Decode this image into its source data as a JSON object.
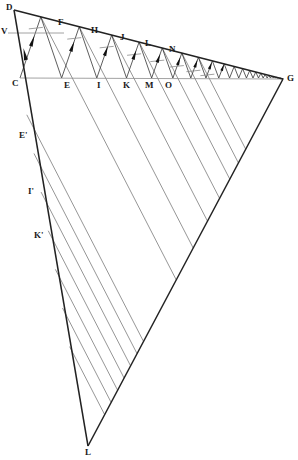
{
  "figure": {
    "background_color": "#ffffff",
    "stroke_color_main": "#222222",
    "stroke_color_thin": "#7a7a7a",
    "arrow_color": "#111111",
    "width": 298,
    "height": 460
  },
  "vertices": {
    "D": {
      "label": "D",
      "x": 14,
      "y": 10,
      "lx": 6,
      "ly": 3
    },
    "V": {
      "label": "V",
      "x": 8,
      "y": 33,
      "lx": 1,
      "ly": 27
    },
    "C": {
      "label": "C",
      "x": 20,
      "y": 78,
      "lx": 12,
      "ly": 79
    },
    "G": {
      "label": "G",
      "x": 283,
      "y": 79,
      "lx": 287,
      "ly": 74
    },
    "L": {
      "label": "L",
      "x": 88,
      "y": 446,
      "lx": 85,
      "ly": 448
    }
  },
  "top_points": [
    {
      "label": "F",
      "x": 62,
      "y": 27,
      "lx": 58,
      "ly": 18
    },
    {
      "label": "H",
      "x": 94,
      "y": 35,
      "lx": 91,
      "ly": 26
    },
    {
      "label": "J",
      "x": 123,
      "y": 42,
      "lx": 120,
      "ly": 33
    },
    {
      "label": "L",
      "x": 148,
      "y": 48,
      "lx": 145,
      "ly": 39
    },
    {
      "label": "N",
      "x": 172,
      "y": 54,
      "lx": 169,
      "ly": 45
    }
  ],
  "bottom_points": [
    {
      "label": "C",
      "x": 20,
      "y": 78
    },
    {
      "label": "E",
      "x": 68,
      "y": 78,
      "lx": 64,
      "ly": 81
    },
    {
      "label": "I",
      "x": 100,
      "y": 78,
      "lx": 97,
      "ly": 81
    },
    {
      "label": "K",
      "x": 127,
      "y": 78,
      "lx": 123,
      "ly": 81
    },
    {
      "label": "M",
      "x": 150,
      "y": 78,
      "lx": 145,
      "ly": 81
    },
    {
      "label": "O",
      "x": 170,
      "y": 78,
      "lx": 165,
      "ly": 81
    }
  ],
  "left_edge_points": [
    {
      "label": "E'",
      "x": 29,
      "y": 136,
      "lx": 19,
      "ly": 131
    },
    {
      "label": "I'",
      "x": 37,
      "y": 192,
      "lx": 28,
      "ly": 187
    },
    {
      "label": "K'",
      "x": 44,
      "y": 236,
      "lx": 34,
      "ly": 231
    }
  ],
  "zigzag": {
    "description": "Alternating chain between the upper line D-G and the horizontal line C-G, compressing toward G",
    "apex_count": 22,
    "base_count": 23
  },
  "parallel_rays": {
    "description": "Parallel diagonal lines from the left edge C-L running down-right to the edge G-L",
    "count": 7
  }
}
